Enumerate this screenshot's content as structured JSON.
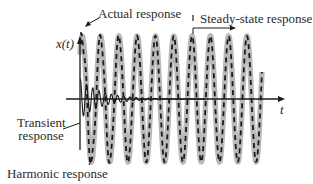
{
  "figure": {
    "labels": {
      "actual_response": "Actual response",
      "steady_state_response": "Steady-state response",
      "x_axis_label": "t",
      "y_axis_label": "x(t)",
      "transient_response_line1": "Transient",
      "transient_response_line2": "response",
      "harmonic_response": "Harmonic response"
    },
    "colors": {
      "harmonic_band": "#b9b9b9",
      "actual_dashes": "#1a1a1a",
      "axes": "#1a1a1a",
      "transient": "#1a1a1a"
    },
    "wave": {
      "x_start": 80,
      "x_end": 262,
      "period_px": 18.3,
      "amplitude_px": 63,
      "baseline_y": 99,
      "transient_decay_px": 22,
      "transient_period_px": 6.2,
      "transient_amplitude_px": 20
    }
  }
}
